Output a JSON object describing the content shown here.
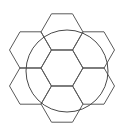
{
  "diagram": {
    "stroke_color": "#5a5a5a",
    "hexagon_side": 21,
    "hexagons": [
      {
        "name": "center",
        "cx": 62,
        "cy": 68
      },
      {
        "name": "top",
        "cx": 62,
        "cy": 32
      },
      {
        "name": "bottom",
        "cx": 62,
        "cy": 104
      },
      {
        "name": "upper-left",
        "cx": 30.5,
        "cy": 50
      },
      {
        "name": "lower-left",
        "cx": 30.5,
        "cy": 86
      },
      {
        "name": "upper-right",
        "cx": 93.5,
        "cy": 50
      },
      {
        "name": "lower-right",
        "cx": 93.5,
        "cy": 86
      }
    ],
    "circle": {
      "cx": 67,
      "cy": 71,
      "r": 41
    }
  }
}
